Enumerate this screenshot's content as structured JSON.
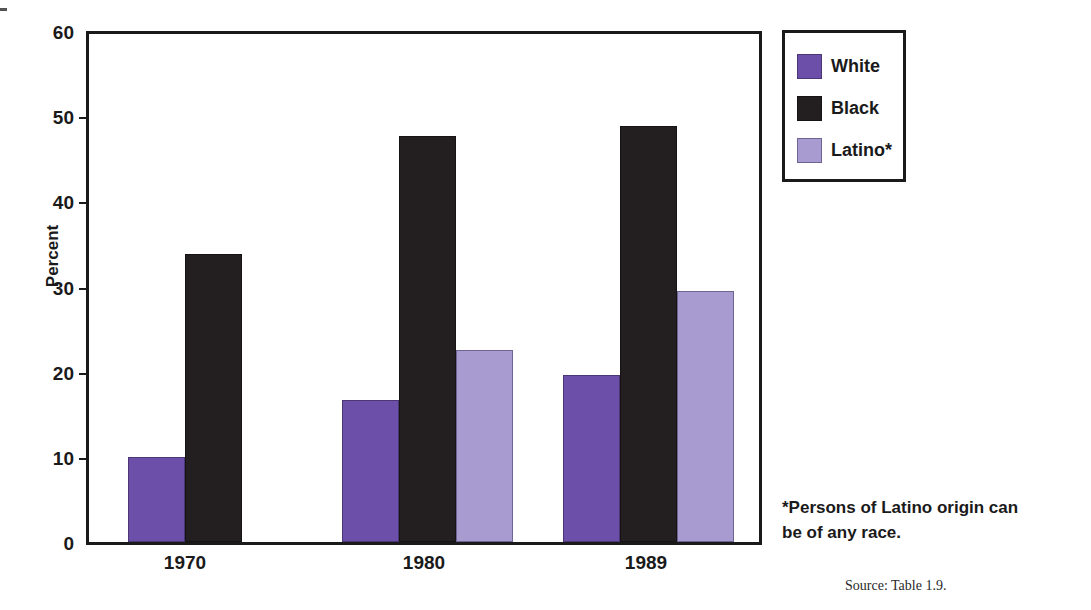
{
  "chart_data": {
    "type": "bar",
    "title": "",
    "xlabel": "",
    "ylabel": "Percent",
    "ylim": [
      0,
      60
    ],
    "yticks": [
      0,
      10,
      20,
      30,
      40,
      50,
      60
    ],
    "ytick_labels": [
      "0",
      "10",
      "20",
      "30",
      "40",
      "50",
      "60"
    ],
    "categories": [
      "1970",
      "1980",
      "1989"
    ],
    "grid": false,
    "legend_position": "right",
    "series": [
      {
        "name": "White",
        "color": "#6b4fa8",
        "values": [
          10.1,
          16.8,
          19.7
        ]
      },
      {
        "name": "Black",
        "color": "#231f20",
        "values": [
          34.0,
          48.0,
          49.1
        ]
      },
      {
        "name": "Latino*",
        "color": "#a79bd0",
        "values": [
          null,
          22.7,
          29.6
        ]
      }
    ],
    "annotations": [
      "*Persons of Latino origin can be of any race.",
      "Source: Table 1.9."
    ]
  },
  "axis": {
    "y_title": "Percent",
    "ticks": [
      {
        "label": "60",
        "value": 60
      },
      {
        "label": "50",
        "value": 50
      },
      {
        "label": "40",
        "value": 40
      },
      {
        "label": "30",
        "value": 30
      },
      {
        "label": "20",
        "value": 20
      },
      {
        "label": "10",
        "value": 10
      },
      {
        "label": "0",
        "value": 0
      }
    ],
    "x_labels": [
      "1970",
      "1980",
      "1989"
    ]
  },
  "legend": {
    "items": [
      {
        "label": "White",
        "color": "#6b4fa8"
      },
      {
        "label": "Black",
        "color": "#231f20"
      },
      {
        "label": "Latino*",
        "color": "#a79bd0"
      }
    ]
  },
  "notes": {
    "footnote_line1": "*Persons of Latino origin can",
    "footnote_line2": "be of any race.",
    "source": "Source: Table 1.9."
  }
}
